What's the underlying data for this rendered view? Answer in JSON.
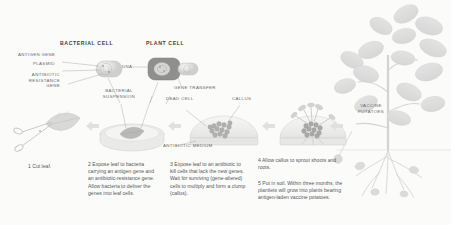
{
  "diagram": {
    "background_color": "#fbfbfa",
    "ink_color": "#6a6a6a"
  },
  "headers": [
    {
      "id": "bacterial-cell",
      "text": "BACTERIAL CELL"
    },
    {
      "id": "plant-cell",
      "text": "PLANT CELL"
    }
  ],
  "labels": [
    {
      "id": "antigen-gene",
      "text": "ANTIGEN GENE"
    },
    {
      "id": "plasmid",
      "text": "PLASMID"
    },
    {
      "id": "antibiotic-resistance-gene",
      "text": "ANTIBIOTIC\nRESISTANCE\nGENE"
    },
    {
      "id": "dna",
      "text": "DNA"
    },
    {
      "id": "bacterial-suspension",
      "text": "BACTERIAL\nSUSPENSION"
    },
    {
      "id": "gene-transfer",
      "text": "GENE TRANSFER"
    },
    {
      "id": "dead-cell",
      "text": "DEAD CELL"
    },
    {
      "id": "callus",
      "text": "CALLUS"
    },
    {
      "id": "antibiotic-medium",
      "text": "ANTIBIOTIC MEDIUM"
    },
    {
      "id": "vaccine-potatoes",
      "text": "VACCINE\nPOTATOES"
    }
  ],
  "steps": [
    {
      "number": "1",
      "text": "1  Cut leaf."
    },
    {
      "number": "2",
      "text": "2  Expose leaf to bacteria carrying an antigen gene and an antibiotic-resistance gene. Allow bacteria to deliver the genes into leaf cells."
    },
    {
      "number": "3",
      "text": "3  Expose leaf to an antibiotic to kill cells that lack the new genes. Wait for surviving (gene-altered) cells to multiply and form a clump (callus)."
    },
    {
      "number": "4",
      "text": "4  Allow callus to sprout shoots and roots."
    },
    {
      "number": "5",
      "text": "5  Put in soil. Within three months, the plantlets will grow into plants bearing antigen-laden vaccine potatoes."
    }
  ]
}
